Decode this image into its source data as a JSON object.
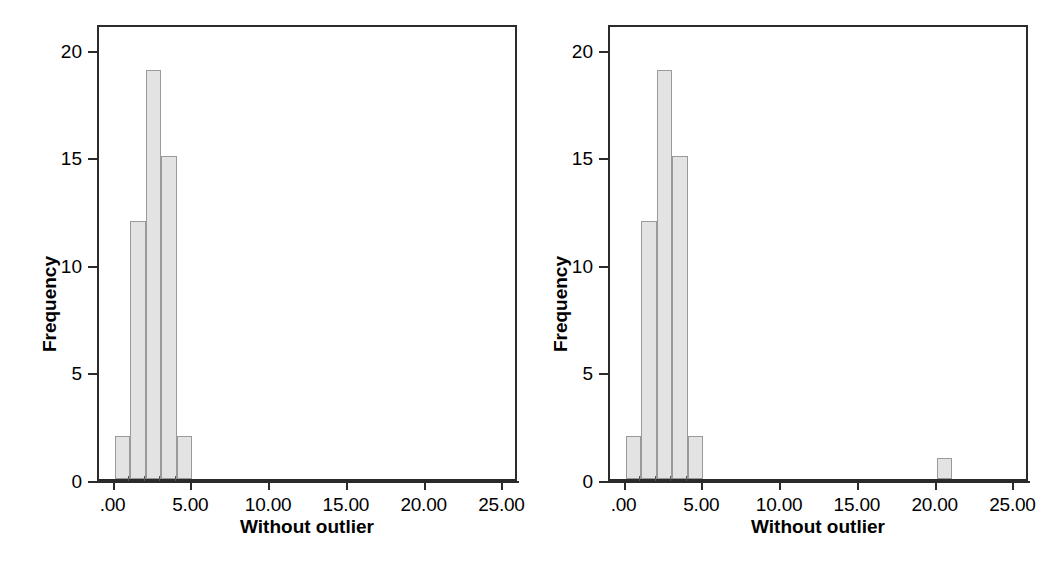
{
  "figure": {
    "panel_count": 2,
    "background_color": "#ffffff",
    "bar_fill_color": "#e3e3e3",
    "bar_border_color": "#9a9a9a",
    "axis_color": "#2b2b2b"
  },
  "chart_data": [
    {
      "type": "bar",
      "title": "",
      "subtitle": "",
      "xlabel": "Without outlier",
      "ylabel": "Frequency",
      "xlim": [
        -1.0,
        26.0
      ],
      "ylim": [
        0,
        21.2
      ],
      "grid": false,
      "legend": null,
      "x_tick_labels": [
        ".00",
        "5.00",
        "10.00",
        "15.00",
        "20.00",
        "25.00"
      ],
      "x_tick_values": [
        0,
        5,
        10,
        15,
        20,
        25
      ],
      "y_tick_labels": [
        "0",
        "5",
        "10",
        "15",
        "20"
      ],
      "y_tick_values": [
        0,
        5,
        10,
        15,
        20
      ],
      "bin_width": 1,
      "bins": [
        {
          "start": 0,
          "end": 1,
          "value": 2
        },
        {
          "start": 1,
          "end": 2,
          "value": 12
        },
        {
          "start": 2,
          "end": 3,
          "value": 19
        },
        {
          "start": 3,
          "end": 4,
          "value": 15
        },
        {
          "start": 4,
          "end": 5,
          "value": 2
        }
      ],
      "categories": [
        "0-1",
        "1-2",
        "2-3",
        "3-4",
        "4-5"
      ],
      "values": [
        2,
        12,
        19,
        15,
        2
      ]
    },
    {
      "type": "bar",
      "title": "",
      "subtitle": "",
      "xlabel": "Without outlier",
      "ylabel": "Frequency",
      "xlim": [
        -1.0,
        26.0
      ],
      "ylim": [
        0,
        21.2
      ],
      "grid": false,
      "legend": null,
      "x_tick_labels": [
        ".00",
        "5.00",
        "10.00",
        "15.00",
        "20.00",
        "25.00"
      ],
      "x_tick_values": [
        0,
        5,
        10,
        15,
        20,
        25
      ],
      "y_tick_labels": [
        "0",
        "5",
        "10",
        "15",
        "20"
      ],
      "y_tick_values": [
        0,
        5,
        10,
        15,
        20
      ],
      "bin_width": 1,
      "bins": [
        {
          "start": 0,
          "end": 1,
          "value": 2
        },
        {
          "start": 1,
          "end": 2,
          "value": 12
        },
        {
          "start": 2,
          "end": 3,
          "value": 19
        },
        {
          "start": 3,
          "end": 4,
          "value": 15
        },
        {
          "start": 4,
          "end": 5,
          "value": 2
        },
        {
          "start": 20,
          "end": 21,
          "value": 1
        }
      ],
      "categories": [
        "0-1",
        "1-2",
        "2-3",
        "3-4",
        "4-5",
        "20-21"
      ],
      "values": [
        2,
        12,
        19,
        15,
        2,
        1
      ]
    }
  ]
}
